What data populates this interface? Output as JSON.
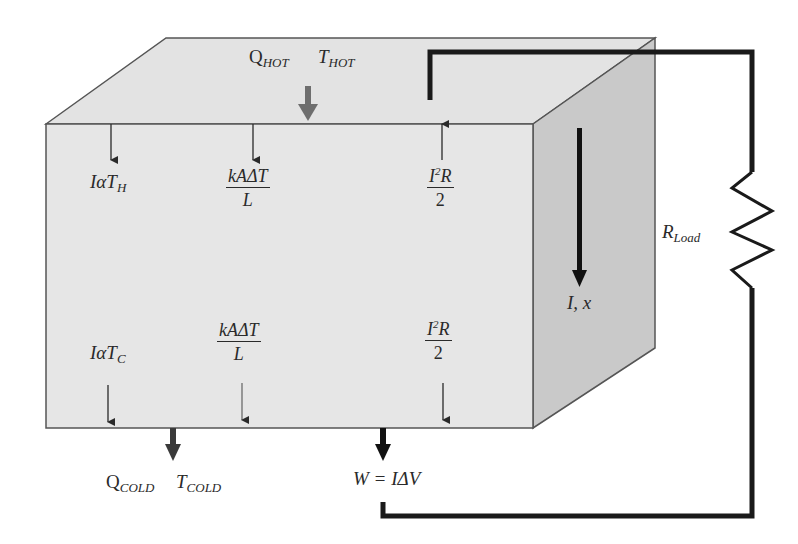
{
  "diagram": {
    "colors": {
      "front_face": "#e6e6e6",
      "top_face": "#e3e3e3",
      "side_face": "#c9c9c9",
      "edge": "#555555",
      "wire": "#1a1a1a",
      "heat_arrow_hot": "#6e6e6e",
      "heat_arrow_cold": "#3a3a3a",
      "thin_arrow": "#2a2a2a"
    },
    "labels": {
      "q_hot": {
        "main": "Q",
        "sub": "HOT"
      },
      "t_hot": {
        "main": "T",
        "sub": "HOT"
      },
      "q_cold": {
        "main": "Q",
        "sub": "COLD"
      },
      "t_cold": {
        "main": "T",
        "sub": "COLD"
      },
      "peltier_hot": {
        "prefix": "Iα",
        "main": "T",
        "sub": "H"
      },
      "peltier_cold": {
        "prefix": "Iα",
        "main": "T",
        "sub": "C"
      },
      "conduction_top": {
        "numerator": "kAΔT",
        "denominator": "L"
      },
      "conduction_bottom": {
        "numerator": "kAΔT",
        "denominator": "L"
      },
      "joule_top": {
        "num_base": "I",
        "num_sup": "2",
        "num_tail": "R",
        "denominator": "2"
      },
      "joule_bottom": {
        "num_base": "I",
        "num_sup": "2",
        "num_tail": "R",
        "denominator": "2"
      },
      "current": "I, x",
      "r_load": {
        "main": "R",
        "sub": "Load"
      },
      "work": "W = IΔV"
    }
  }
}
